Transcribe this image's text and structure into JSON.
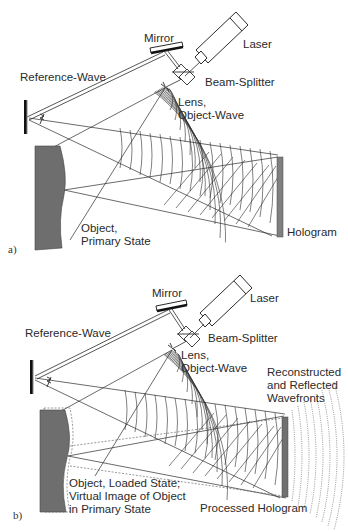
{
  "figure": {
    "panels": [
      {
        "id": "a",
        "panel_label": "a)",
        "labels": {
          "mirror": "Mirror",
          "laser": "Laser",
          "reference_wave": "Reference-Wave",
          "beam_splitter": "Beam-Splitter",
          "lens": "Lens,\nObject-Wave",
          "object": "Object,\nPrimary State",
          "hologram": "Hologram"
        }
      },
      {
        "id": "b",
        "panel_label": "b)",
        "labels": {
          "mirror": "Mirror",
          "laser": "Laser",
          "reference_wave": "Reference-Wave",
          "beam_splitter": "Beam-Splitter",
          "lens": "Lens,\nObject-Wave",
          "reconstructed": "Reconstructed\nand Reflected\nWavefronts",
          "object": "Object, Loaded State;\nVirtual Image of Object\nin Primary State",
          "hologram": "Processed Hologram"
        }
      }
    ],
    "colors": {
      "line": "#2b2b2b",
      "object_fill": "#6e6e6e",
      "hologram_fill": "#808080",
      "text": "#2a2a2a"
    }
  }
}
